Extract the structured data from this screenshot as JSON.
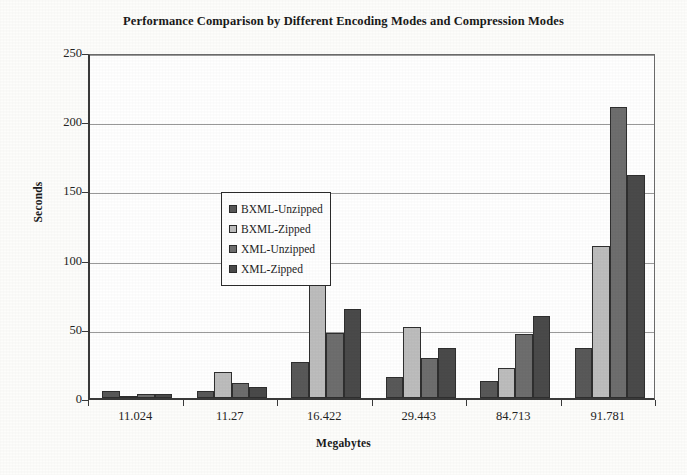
{
  "chart_data": {
    "type": "bar",
    "title": "Performance Comparison by Different Encoding Modes and Compression Modes",
    "xlabel": "Megabytes",
    "ylabel": "Seconds",
    "categories": [
      "11.024",
      "11.27",
      "16.422",
      "29.443",
      "84.713",
      "91.781"
    ],
    "series": [
      {
        "name": "BXML-Unzipped",
        "color": "#595959",
        "values": [
          5,
          5,
          26,
          15,
          12,
          36
        ]
      },
      {
        "name": "BXML-Zipped",
        "color": "#bdbdbd",
        "values": [
          1,
          19,
          90,
          51,
          22,
          110
        ]
      },
      {
        "name": "XML-Unzipped",
        "color": "#6e6e6e",
        "values": [
          3,
          11,
          47,
          29,
          46,
          210
        ]
      },
      {
        "name": "XML-Zipped",
        "color": "#4a4a4a",
        "values": [
          3,
          8,
          64,
          36,
          59,
          161
        ]
      }
    ],
    "ylim": [
      0,
      250
    ],
    "yticks": [
      0,
      50,
      100,
      150,
      200,
      250
    ],
    "ytick_labels": [
      "0",
      "50",
      "100",
      "150",
      "200",
      "250"
    ],
    "grid": true,
    "legend_position": "upper-left-inside",
    "legend_entries": [
      "BXML-Unzipped",
      "BXML-Zipped",
      "XML-Unzipped",
      "XML-Zipped"
    ]
  }
}
